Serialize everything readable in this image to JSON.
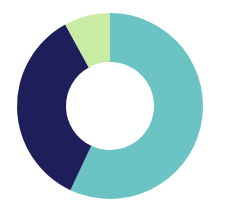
{
  "chart_data": {
    "type": "pie",
    "variant": "donut",
    "title": "",
    "legend": [],
    "start_angle_deg": 0,
    "direction": "clockwise",
    "center": [
      110,
      106
    ],
    "outer_radius": 93,
    "inner_radius": 44,
    "slices": [
      {
        "label": "",
        "value": 57,
        "color": "#6cc3c4"
      },
      {
        "label": "",
        "value": 35,
        "color": "#1e1e5a"
      },
      {
        "label": "",
        "value": 8,
        "color": "#c9eca4"
      }
    ]
  },
  "background": "#ffffff"
}
